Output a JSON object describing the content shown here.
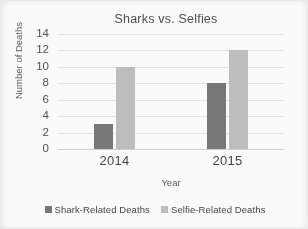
{
  "chart_data": {
    "type": "bar",
    "title": "Sharks vs. Selfies",
    "xlabel": "Year",
    "ylabel": "Number of Deaths",
    "categories": [
      "2014",
      "2015"
    ],
    "series": [
      {
        "name": "Shark-Related Deaths",
        "values": [
          3,
          8
        ],
        "color": "#757575",
        "legend_icon": "square-swatch-dark"
      },
      {
        "name": "Selfie-Related Deaths",
        "values": [
          10,
          12
        ],
        "color": "#bdbdbd",
        "legend_icon": "square-swatch-light"
      }
    ],
    "ylim": [
      0,
      14
    ],
    "ytick_labels": [
      "14",
      "12",
      "10",
      "8",
      "6",
      "4",
      "2",
      "0"
    ],
    "ytick_values": [
      14,
      12,
      10,
      8,
      6,
      4,
      2,
      0
    ],
    "ytick_step": 2,
    "grid": {
      "horizontal": true,
      "vertical": false,
      "color": "#e2e2e2"
    },
    "legend_position": "bottom",
    "plot_background": "#fdfdfd"
  }
}
